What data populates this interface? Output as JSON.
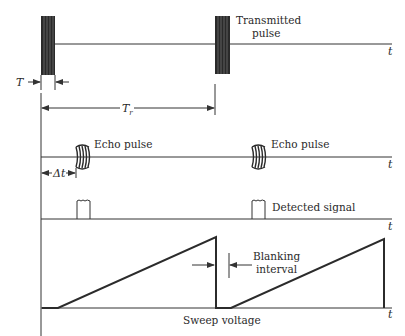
{
  "diagram": {
    "rows": [
      {
        "id": "transmitted",
        "label": "Transmitted\npulse",
        "label_lines": [
          "Transmitted",
          "pulse"
        ],
        "axis_label": "t"
      },
      {
        "id": "echo",
        "label": "Echo pulse",
        "axis_label": "t"
      },
      {
        "id": "detected",
        "label": "Detected signal",
        "axis_label": "t"
      },
      {
        "id": "sweep",
        "label": "Sweep voltage",
        "axis_label": "t"
      }
    ],
    "annotations": {
      "pulse_width": "T",
      "repetition_period": "T",
      "repetition_period_sub": "r",
      "delay": "Δt",
      "blanking_lines": [
        "Blanking",
        "interval"
      ]
    },
    "labels": {
      "transmitted_1": "Transmitted",
      "transmitted_2": "pulse",
      "echo_1": "Echo pulse",
      "echo_2": "Echo pulse",
      "detected": "Detected signal",
      "blanking_1": "Blanking",
      "blanking_2": "interval",
      "sweep": "Sweep voltage",
      "t": "t",
      "T": "T",
      "Tr": "T",
      "Tr_sub": "r",
      "dt": "Δt"
    },
    "colors": {
      "ink": "#2b2b2b",
      "background": "#ffffff"
    }
  }
}
